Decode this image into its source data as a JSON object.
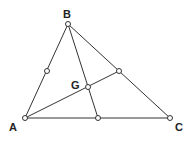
{
  "diagram": {
    "vertices": {
      "A": {
        "label": "A",
        "x": 25,
        "y": 118
      },
      "B": {
        "label": "B",
        "x": 68,
        "y": 24
      },
      "C": {
        "label": "C",
        "x": 170,
        "y": 118
      }
    },
    "centroid": {
      "label": "G",
      "x": 88,
      "y": 87
    },
    "midpoints": {
      "AB": {
        "x": 47,
        "y": 71
      },
      "BC": {
        "x": 119,
        "y": 71
      },
      "AC": {
        "x": 98,
        "y": 118
      }
    },
    "labels": {
      "A": "A",
      "B": "B",
      "C": "C",
      "G": "G"
    }
  }
}
